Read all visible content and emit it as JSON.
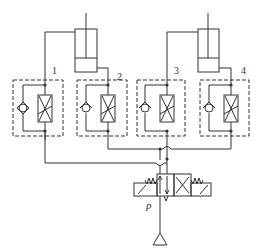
{
  "diagram": {
    "colors": {
      "line": "#333333",
      "background": "#ffffff"
    },
    "valve_labels": [
      "1",
      "2",
      "3",
      "4"
    ],
    "supply_label": "p",
    "components": [
      {
        "id": "cylinder-1",
        "type": "double-acting cylinder"
      },
      {
        "id": "cylinder-2",
        "type": "double-acting cylinder"
      },
      {
        "id": "valve-1",
        "type": "one-way throttle valve",
        "label": "1"
      },
      {
        "id": "valve-2",
        "type": "one-way throttle valve",
        "label": "2"
      },
      {
        "id": "valve-3",
        "type": "one-way throttle valve",
        "label": "3"
      },
      {
        "id": "valve-4",
        "type": "one-way throttle valve",
        "label": "4"
      },
      {
        "id": "directional-valve",
        "type": "solenoid directional control valve with springs"
      },
      {
        "id": "pressure-source",
        "type": "pressure source",
        "label": "p"
      }
    ]
  }
}
